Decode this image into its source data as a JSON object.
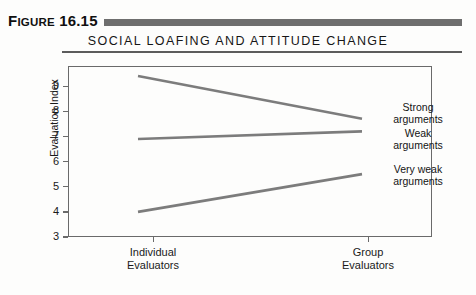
{
  "figure": {
    "number_label": "FIGURE 16.15",
    "number_prefix": "F",
    "number_rest": "IGURE",
    "number_value": "16.15",
    "title": "SOCIAL LOAFING AND ATTITUDE CHANGE"
  },
  "colors": {
    "rule": "#6e6e6e",
    "frame": "#6a6a6a",
    "line": "#7c7c7c",
    "text": "#1a1a1a"
  },
  "chart_data": {
    "type": "line",
    "title": "SOCIAL LOAFING AND ATTITUDE CHANGE",
    "xlabel": "",
    "ylabel": "Evaluation Index",
    "categories": [
      "Individual Evaluators",
      "Group Evaluators"
    ],
    "x_tick_labels": [
      {
        "line1": "Individual",
        "line2": "Evaluators"
      },
      {
        "line1": "Group",
        "line2": "Evaluators"
      }
    ],
    "ylim": [
      3,
      9.8
    ],
    "y_ticks": [
      3,
      4,
      5,
      6,
      7,
      8,
      9
    ],
    "y_tick_labels": [
      "3",
      "4",
      "5",
      "6",
      "7",
      "8",
      "9"
    ],
    "grid": false,
    "legend_position": "right-inline",
    "series": [
      {
        "name": "Strong arguments",
        "label_line1": "Strong",
        "label_line2": "arguments",
        "values": [
          9.4,
          7.7
        ]
      },
      {
        "name": "Weak arguments",
        "label_line1": "Weak",
        "label_line2": "arguments",
        "values": [
          6.9,
          7.2
        ]
      },
      {
        "name": "Very weak arguments",
        "label_line1": "Very weak",
        "label_line2": "arguments",
        "values": [
          4.0,
          5.5
        ]
      }
    ]
  }
}
